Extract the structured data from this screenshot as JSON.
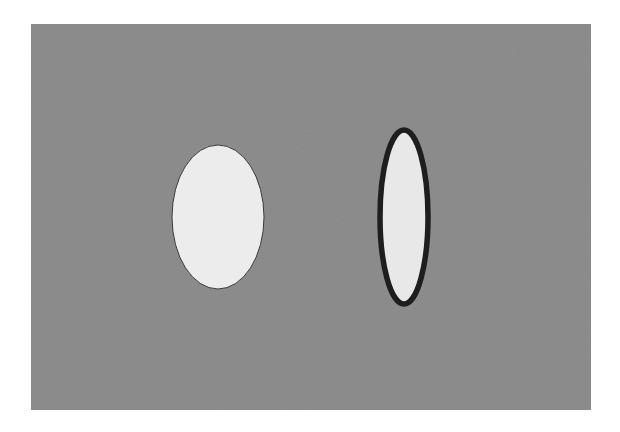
{
  "scene": {
    "background": {
      "x": 31,
      "y": 24,
      "width": 560,
      "height": 386,
      "fill": "#8e8e8e"
    },
    "shapes": [
      {
        "name": "left-ellipse",
        "cx": 218,
        "cy": 217,
        "rx": 46,
        "ry": 72,
        "fill": "#ececec",
        "stroke": "#3a3a3a",
        "stroke_width": 1
      },
      {
        "name": "right-ellipse",
        "cx": 404,
        "cy": 217,
        "rx": 24,
        "ry": 87,
        "fill": "#e8e8e8",
        "stroke": "#1e1e1e",
        "stroke_width": 5.5
      }
    ]
  }
}
